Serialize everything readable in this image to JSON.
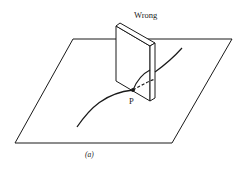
{
  "figure": {
    "title_label": "Wrong",
    "point_label": "P",
    "caption": "(a)"
  },
  "colors": {
    "ink": "#1a1a1a",
    "background": "#ffffff"
  }
}
